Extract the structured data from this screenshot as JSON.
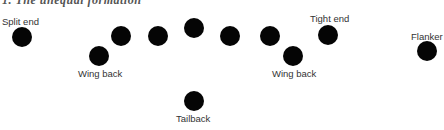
{
  "diagram": {
    "title": "1. The unequal formation",
    "dot_color": "#050505",
    "players": [
      {
        "id": "split-end",
        "label": "Split end",
        "x": 22,
        "y": 37,
        "label_x": 2,
        "label_y": 16
      },
      {
        "id": "wing-back-left",
        "label": "Wing back",
        "x": 99,
        "y": 56,
        "label_x": 78,
        "label_y": 68
      },
      {
        "id": "lineman-1",
        "label": "",
        "x": 121,
        "y": 36
      },
      {
        "id": "lineman-2",
        "label": "",
        "x": 158,
        "y": 36
      },
      {
        "id": "center",
        "label": "",
        "x": 194,
        "y": 28
      },
      {
        "id": "lineman-4",
        "label": "",
        "x": 230,
        "y": 36
      },
      {
        "id": "lineman-5",
        "label": "",
        "x": 270,
        "y": 36
      },
      {
        "id": "wing-back-right",
        "label": "Wing back",
        "x": 293,
        "y": 56,
        "label_x": 272,
        "label_y": 68
      },
      {
        "id": "tight-end",
        "label": "Tight end",
        "x": 328,
        "y": 35,
        "label_x": 310,
        "label_y": 13
      },
      {
        "id": "flanker",
        "label": "Flanker",
        "x": 427,
        "y": 51,
        "label_x": 411,
        "label_y": 31
      },
      {
        "id": "tailback",
        "label": "Tailback",
        "x": 194,
        "y": 101,
        "label_x": 176,
        "label_y": 113
      }
    ]
  }
}
